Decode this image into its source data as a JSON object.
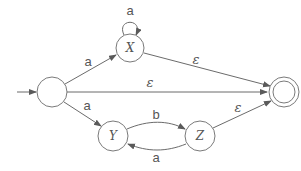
{
  "diagram": {
    "type": "nfa",
    "states": [
      {
        "id": "start",
        "label": "",
        "initial": true,
        "accepting": false
      },
      {
        "id": "X",
        "label": "X",
        "initial": false,
        "accepting": false
      },
      {
        "id": "Y",
        "label": "Y",
        "initial": false,
        "accepting": false
      },
      {
        "id": "Z",
        "label": "Z",
        "initial": false,
        "accepting": false
      },
      {
        "id": "final",
        "label": "",
        "initial": false,
        "accepting": true
      }
    ],
    "transitions": [
      {
        "from": "start",
        "to": "X",
        "label": "a"
      },
      {
        "from": "X",
        "to": "X",
        "label": "a"
      },
      {
        "from": "X",
        "to": "final",
        "label": "ε"
      },
      {
        "from": "start",
        "to": "final",
        "label": "ε"
      },
      {
        "from": "start",
        "to": "Y",
        "label": "a"
      },
      {
        "from": "Y",
        "to": "Z",
        "label": "b"
      },
      {
        "from": "Z",
        "to": "Y",
        "label": "a"
      },
      {
        "from": "Z",
        "to": "final",
        "label": "ε"
      }
    ]
  },
  "labels": {
    "state_x": "X",
    "state_y": "Y",
    "state_z": "Z",
    "edge_start_x": "a",
    "edge_x_loop": "a",
    "edge_x_final": "ε",
    "edge_start_final": "ε",
    "edge_start_y": "a",
    "edge_y_z": "b",
    "edge_z_y": "a",
    "edge_z_final": "ε"
  }
}
